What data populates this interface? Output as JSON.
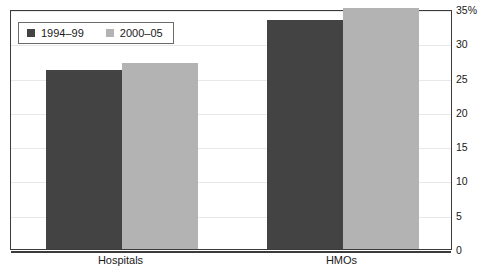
{
  "clipped_title_remnant": "",
  "chart_data": {
    "type": "bar",
    "title": "",
    "xlabel": "",
    "ylabel": "",
    "categories": [
      "Hospitals",
      "HMOs"
    ],
    "series": [
      {
        "name": "1994–99",
        "color": "#434343",
        "values": [
          26.1,
          33.4
        ]
      },
      {
        "name": "2000–05",
        "color": "#b3b3b3",
        "values": [
          27.2,
          35.2
        ]
      }
    ],
    "ylim": [
      0,
      35
    ],
    "ytick_values": [
      0,
      5,
      10,
      15,
      20,
      25,
      30,
      35
    ],
    "ytick_labels": [
      "0",
      "5",
      "10",
      "15",
      "20",
      "25",
      "30",
      "35%"
    ],
    "grid": true,
    "grid_axis": "y",
    "legend_position": "upper-left-inside",
    "axis_label_side": "right"
  },
  "legend": {
    "entries": [
      {
        "label": "1994–99",
        "swatch": "dark"
      },
      {
        "label": "2000–05",
        "swatch": "light"
      }
    ]
  },
  "colors": {
    "series_dark": "#434343",
    "series_light": "#b3b3b3",
    "frame": "#3b3b3b",
    "gridline": "#e8e8e8",
    "background": "#ffffff"
  }
}
